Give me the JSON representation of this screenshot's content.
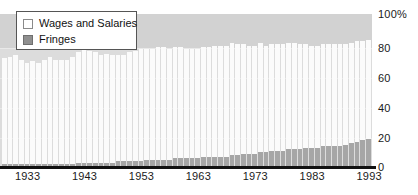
{
  "chart_data": {
    "type": "bar",
    "stacked": true,
    "title": "",
    "subtitle": "",
    "xlabel": "",
    "ylabel": "",
    "ylim": [
      0,
      100
    ],
    "grid": true,
    "legend_position": "top-left",
    "y_ticks": [
      "100%",
      "80",
      "60",
      "40",
      "20",
      "0"
    ],
    "y_tick_values": [
      100,
      80,
      60,
      40,
      20,
      0
    ],
    "x_ticks": [
      "1933",
      "1943",
      "1953",
      "1963",
      "1973",
      "1983",
      "1993"
    ],
    "x_tick_values": [
      1933,
      1943,
      1953,
      1963,
      1973,
      1983,
      1993
    ],
    "categories": [
      1929,
      1930,
      1931,
      1932,
      1933,
      1934,
      1935,
      1936,
      1937,
      1938,
      1939,
      1940,
      1941,
      1942,
      1943,
      1944,
      1945,
      1946,
      1947,
      1948,
      1949,
      1950,
      1951,
      1952,
      1953,
      1954,
      1955,
      1956,
      1957,
      1958,
      1959,
      1960,
      1961,
      1962,
      1963,
      1964,
      1965,
      1966,
      1967,
      1968,
      1969,
      1970,
      1971,
      1972,
      1973,
      1974,
      1975,
      1976,
      1977,
      1978,
      1979,
      1980,
      1981,
      1982,
      1983,
      1984,
      1985,
      1986,
      1987,
      1988,
      1989,
      1990,
      1991,
      1992,
      1993
    ],
    "series": [
      {
        "name": "Wages and Salaries",
        "color": "#fbfbfb",
        "values": [
          70,
          71,
          72,
          69,
          67,
          68,
          67,
          69,
          71,
          69,
          69,
          69,
          71,
          73,
          75,
          74,
          73,
          71,
          72,
          71,
          70,
          70,
          72,
          73,
          74,
          73,
          73,
          74,
          74,
          73,
          73,
          73,
          72,
          72,
          72,
          72,
          72,
          73,
          73,
          73,
          74,
          73,
          72,
          71,
          71,
          72,
          70,
          70,
          70,
          70,
          70,
          70,
          69,
          68,
          67,
          67,
          67,
          67,
          67,
          67,
          66,
          66,
          66,
          65,
          65
        ]
      },
      {
        "name": "Fringes",
        "color": "#a6a6a6",
        "values": [
          1,
          1,
          1,
          1,
          1,
          1,
          1,
          1,
          1,
          1,
          1,
          1,
          1,
          2,
          2,
          2,
          2,
          2,
          2,
          2,
          3,
          3,
          3,
          3,
          3,
          4,
          4,
          4,
          4,
          4,
          5,
          5,
          5,
          5,
          5,
          6,
          6,
          6,
          6,
          6,
          7,
          7,
          8,
          8,
          8,
          9,
          9,
          10,
          10,
          10,
          11,
          11,
          11,
          12,
          12,
          12,
          13,
          13,
          13,
          13,
          14,
          15,
          16,
          17,
          18
        ]
      }
    ]
  },
  "legend": {
    "items": [
      {
        "label": "Wages and Salaries",
        "swatch": "wages-swatch"
      },
      {
        "label": "Fringes",
        "swatch": "fringes-swatch"
      }
    ]
  },
  "colors": {
    "plot_background_upper": "#d2d2d2",
    "plot_background_lower": "#dcdcdc",
    "wages": "#fbfbfb",
    "fringes": "#a6a6a6",
    "axis": "#111111",
    "gridline": "#e8e8e8",
    "legend_border": "#555555"
  }
}
